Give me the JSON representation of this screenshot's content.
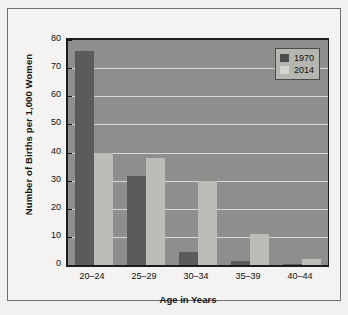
{
  "chart_data": {
    "type": "bar",
    "title": "",
    "xlabel": "Age in Years",
    "ylabel": "Number of Births per 1,000 Women",
    "categories": [
      "20–24",
      "25–29",
      "30–34",
      "35–39",
      "40–44"
    ],
    "series": [
      {
        "name": "1970",
        "color": "#5b5b5b",
        "values": [
          76,
          31.5,
          4.8,
          1.5,
          0.3
        ]
      },
      {
        "name": "2014",
        "color": "#bdbdb8",
        "values": [
          40,
          38,
          30,
          11.2,
          2
        ]
      }
    ],
    "ylim": [
      0,
      80
    ],
    "yticks": [
      0,
      10,
      20,
      30,
      40,
      50,
      60,
      70,
      80
    ],
    "ytick_labels": [
      "0",
      "10",
      "20",
      "30",
      "40",
      "50",
      "60",
      "70",
      "80"
    ],
    "grid": true,
    "legend_position": "top-right",
    "legend_entries": [
      "1970",
      "2014"
    ],
    "plot_background": "#8e8e8e",
    "gridline_color": "#d9d9d4",
    "axis_color": "#1c1c1c",
    "figure_background": "#f4f3f1"
  }
}
